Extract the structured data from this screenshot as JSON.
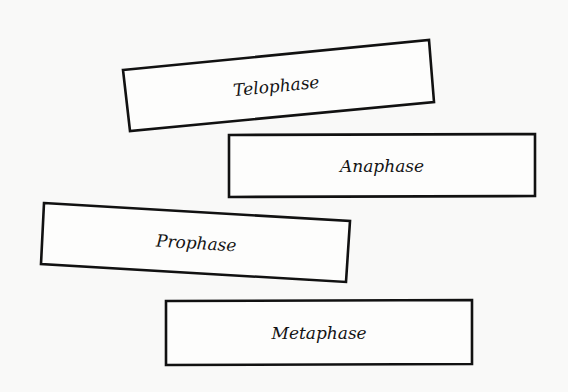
{
  "diagram": {
    "type": "card-sort",
    "cards": [
      {
        "id": "telophase",
        "label": "Telophase",
        "points": "123,70 429,40 434,102 130,131",
        "text_x": 276,
        "text_y": 86,
        "rotate": -5.6
      },
      {
        "id": "anaphase",
        "label": "Anaphase",
        "points": "229,135 535,134 535,196 229,197",
        "text_x": 382,
        "text_y": 166,
        "rotate": 0
      },
      {
        "id": "prophase",
        "label": "Prophase",
        "points": "44,203 350,221 346,282 41,264",
        "text_x": 196,
        "text_y": 243,
        "rotate": 3.4
      },
      {
        "id": "metaphase",
        "label": "Metaphase",
        "points": "166,301 472,300 472,364 166,365",
        "text_x": 319,
        "text_y": 333,
        "rotate": 0
      }
    ]
  },
  "colors": {
    "stroke": "#111111",
    "card_fill": "#fdfdfc",
    "background": "#f9f9f8",
    "text": "#141414"
  }
}
